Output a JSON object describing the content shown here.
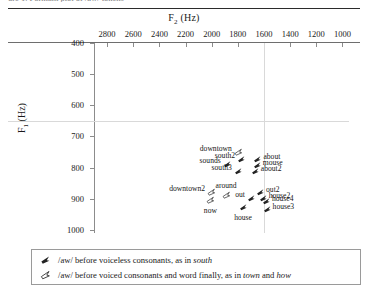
{
  "cut_off_caption": "ure 1. Formant plot of /aw/ tokens",
  "axes": {
    "x_title": "F2 (Hz)",
    "x_title_main": "F",
    "x_title_sub": "2",
    "x_title_unit": "(Hz)",
    "y_title_main": "F",
    "y_title_sub": "1",
    "y_title_unit": "(Hz)",
    "x_ticks": [
      2800,
      2600,
      2400,
      2200,
      2000,
      1800,
      1600,
      1400,
      1200,
      1000
    ],
    "y_ticks": [
      400,
      500,
      600,
      700,
      800,
      900,
      1000
    ]
  },
  "legend": {
    "rows": [
      {
        "glyph": "dart-filled-icon",
        "pre": "/aw/ before voiceless consonants, as in ",
        "em1": "south",
        "mid": "",
        "em2": "",
        "post": ""
      },
      {
        "glyph": "dart-open-icon",
        "pre": "/aw/ before voiced consonants and word finally, as in ",
        "em1": "town",
        "mid": " and ",
        "em2": "how",
        "post": ""
      }
    ]
  },
  "chart_data": {
    "type": "scatter",
    "title": "Formant plot of /aw/ tokens",
    "xlabel": "F2 (Hz)",
    "ylabel": "F1 (Hz)",
    "xlim": [
      2900,
      950
    ],
    "ylim": [
      400,
      1010
    ],
    "x_inverted": true,
    "y_inverted": true,
    "grid": false,
    "reference_lines": {
      "horizontal_f1": 650,
      "vertical_f2": 1600
    },
    "legend_position": "below-plot",
    "series": [
      {
        "name": "/aw/ before voiceless consonants, as in south",
        "marker": "dart-filled",
        "points": [
          {
            "label": "sounds",
            "f2": 1885,
            "f1": 787,
            "label_pos": "left"
          },
          {
            "label": "south2",
            "f2": 1775,
            "f1": 772,
            "label_pos": "left"
          },
          {
            "label": "south3",
            "f2": 1800,
            "f1": 812,
            "label_pos": "left"
          },
          {
            "label": "about",
            "f2": 1650,
            "f1": 772,
            "label_pos": "right"
          },
          {
            "label": "mouse",
            "f2": 1655,
            "f1": 792,
            "label_pos": "right"
          },
          {
            "label": "about2",
            "f2": 1670,
            "f1": 812,
            "label_pos": "right"
          },
          {
            "label": "out",
            "f2": 1700,
            "f1": 898,
            "label_pos": "left"
          },
          {
            "label": "out2",
            "f2": 1630,
            "f1": 878,
            "label_pos": "right"
          },
          {
            "label": "house2",
            "f2": 1610,
            "f1": 898,
            "label_pos": "right"
          },
          {
            "label": "house4",
            "f2": 1585,
            "f1": 908,
            "label_pos": "right"
          },
          {
            "label": "house3",
            "f2": 1580,
            "f1": 932,
            "label_pos": "right"
          },
          {
            "label": "house",
            "f2": 1760,
            "f1": 928,
            "label_pos": "below"
          }
        ]
      },
      {
        "name": "/aw/ before voiced consonants and word finally, as in town and how",
        "marker": "dart-open",
        "points": [
          {
            "label": "downtown",
            "f2": 1800,
            "f1": 750,
            "label_pos": "left"
          },
          {
            "label": "downtown2",
            "f2": 2005,
            "f1": 878,
            "label_pos": "left"
          },
          {
            "label": "now",
            "f2": 2010,
            "f1": 905,
            "label_pos": "below"
          },
          {
            "label": "around",
            "f2": 1890,
            "f1": 888,
            "label_pos": "above"
          }
        ]
      }
    ]
  }
}
